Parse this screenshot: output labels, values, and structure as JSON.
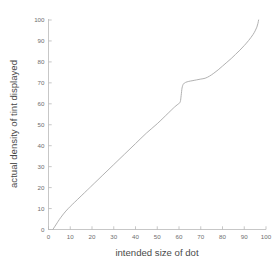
{
  "chart_data": {
    "type": "line",
    "title": "",
    "subtitle": "",
    "xlabel": "intended size of dot",
    "ylabel": "actual density of tint displayed",
    "xlim": [
      0,
      100
    ],
    "ylim": [
      0,
      100
    ],
    "xticks": [
      0,
      10,
      20,
      30,
      40,
      50,
      60,
      70,
      80,
      90,
      100
    ],
    "yticks": [
      0,
      10,
      20,
      30,
      40,
      50,
      60,
      70,
      80,
      90,
      100
    ],
    "xtick_labels": [
      "0",
      "10",
      "20",
      "30",
      "40",
      "50",
      "60",
      "70",
      "80",
      "90",
      "100"
    ],
    "ytick_labels": [
      "0",
      "10",
      "20",
      "30",
      "40",
      "50",
      "60",
      "70",
      "80",
      "90",
      "100"
    ],
    "grid": false,
    "legend": false,
    "legend_position": "none",
    "line_color": "#a8a8a8",
    "axis_color": "#b9b9b9",
    "background_color": "#ffffff",
    "annotations": [],
    "series": [
      {
        "name": "dot gain curve",
        "x": [
          2.0,
          3.0,
          4.0,
          5.0,
          6.5,
          8.0,
          10.0,
          12.0,
          15.0,
          18.0,
          20.0,
          25.0,
          30.0,
          35.0,
          40.0,
          45.0,
          50.0,
          55.0,
          58.0,
          60.0,
          60.6,
          61.0,
          61.4,
          62.0,
          63.0,
          64.5,
          66.0,
          68.0,
          70.0,
          72.0,
          74.0,
          76.0,
          78.0,
          80.0,
          82.0,
          84.0,
          86.0,
          88.0,
          90.0,
          92.0,
          94.0,
          95.0,
          95.8,
          96.3,
          96.6
        ],
        "y": [
          0.0,
          1.6,
          3.2,
          4.8,
          6.9,
          8.8,
          11.0,
          13.0,
          16.0,
          19.0,
          21.0,
          26.0,
          31.0,
          36.0,
          41.0,
          46.0,
          50.5,
          55.5,
          58.5,
          60.2,
          61.0,
          64.0,
          67.5,
          69.4,
          70.2,
          70.7,
          71.0,
          71.4,
          71.8,
          72.2,
          73.2,
          74.6,
          76.2,
          78.0,
          79.8,
          81.6,
          83.6,
          85.6,
          87.8,
          90.2,
          93.0,
          94.8,
          96.6,
          98.4,
          100.0
        ]
      }
    ]
  },
  "axes": {
    "x_title": "intended size of dot",
    "y_title": "actual density of tint displayed"
  }
}
